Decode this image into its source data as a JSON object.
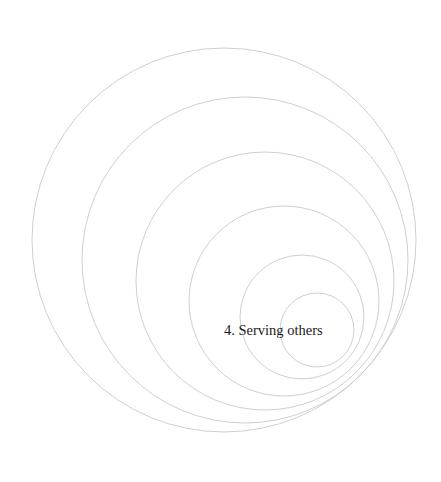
{
  "diagram": {
    "type": "nested-circles",
    "stroke_color": "#cfcfcf",
    "text_color": "#1a1a1a",
    "circles": [
      {
        "cx": 224,
        "cy": 240,
        "r": 192
      },
      {
        "cx": 245,
        "cy": 260,
        "r": 163
      },
      {
        "cx": 265,
        "cy": 281,
        "r": 129
      },
      {
        "cx": 284,
        "cy": 301,
        "r": 95
      },
      {
        "cx": 302,
        "cy": 317,
        "r": 62
      },
      {
        "cx": 317,
        "cy": 330,
        "r": 37
      }
    ],
    "label": {
      "text": "4. Serving others",
      "x": 224,
      "y": 335
    }
  }
}
